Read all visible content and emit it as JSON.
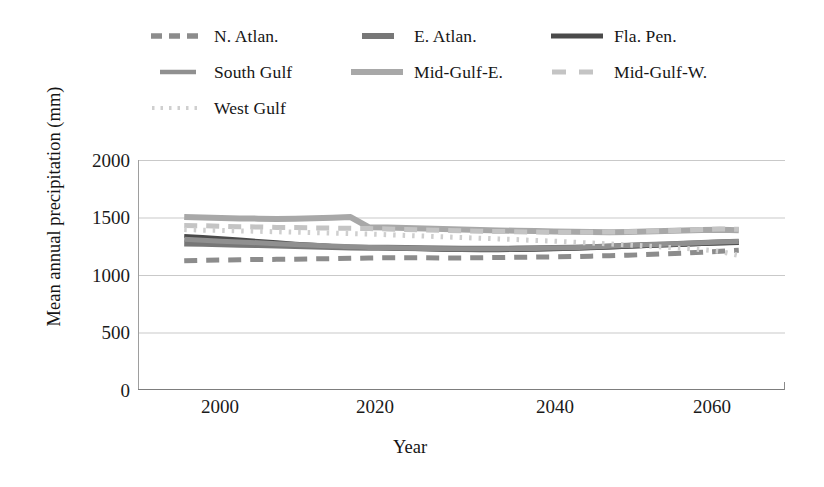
{
  "chart_data": {
    "type": "line",
    "title": "",
    "xlabel": "Year",
    "ylabel": "Mean annual precipitation (mm)",
    "xlim": [
      1995,
      2065
    ],
    "ylim": [
      0,
      2000
    ],
    "yticks": [
      "2000",
      "1500",
      "1000",
      "500",
      "0"
    ],
    "ytick_values": [
      2000,
      1500,
      1000,
      500,
      0
    ],
    "xticks": [
      "2000",
      "2020",
      "2040",
      "2060"
    ],
    "xtick_values": [
      2000,
      2020,
      2040,
      2060
    ],
    "grid": "horizontal",
    "legend_position": "top",
    "x": [
      2000,
      2002,
      2004,
      2006,
      2008,
      2010,
      2012,
      2014,
      2016,
      2018,
      2020,
      2022,
      2024,
      2026,
      2028,
      2030,
      2032,
      2034,
      2036,
      2038,
      2040,
      2042,
      2044,
      2046,
      2048,
      2050,
      2052,
      2054,
      2056,
      2058,
      2060
    ],
    "series": [
      {
        "name": "N. Atlan.",
        "color": "#8c8c8c",
        "dash": "dashed",
        "width": 5,
        "values": [
          1125,
          1128,
          1130,
          1132,
          1135,
          1136,
          1138,
          1140,
          1142,
          1145,
          1148,
          1150,
          1150,
          1150,
          1148,
          1148,
          1150,
          1152,
          1154,
          1156,
          1158,
          1160,
          1164,
          1168,
          1172,
          1178,
          1184,
          1190,
          1198,
          1206,
          1215
        ]
      },
      {
        "name": "E. Atlan.",
        "color": "#777777",
        "dash": "solid-thick",
        "width": 6,
        "values": [
          1275,
          1272,
          1268,
          1264,
          1260,
          1256,
          1252,
          1248,
          1244,
          1240,
          1238,
          1236,
          1234,
          1232,
          1230,
          1228,
          1228,
          1228,
          1230,
          1232,
          1234,
          1238,
          1242,
          1248,
          1254,
          1260,
          1266,
          1272,
          1278,
          1284,
          1290
        ]
      },
      {
        "name": "Fla. Pen.",
        "color": "#4a4a4a",
        "dash": "solid",
        "width": 4,
        "values": [
          1340,
          1330,
          1320,
          1308,
          1296,
          1284,
          1272,
          1262,
          1252,
          1244,
          1238,
          1232,
          1228,
          1224,
          1220,
          1218,
          1216,
          1216,
          1218,
          1220,
          1224,
          1228,
          1234,
          1240,
          1246,
          1252,
          1258,
          1264,
          1270,
          1274,
          1278
        ]
      },
      {
        "name": "South Gulf",
        "color": "#909090",
        "dash": "solid",
        "width": 5,
        "values": [
          1310,
          1302,
          1294,
          1288,
          1280,
          1272,
          1266,
          1258,
          1252,
          1246,
          1240,
          1236,
          1232,
          1230,
          1228,
          1226,
          1226,
          1226,
          1228,
          1230,
          1234,
          1238,
          1244,
          1250,
          1256,
          1262,
          1268,
          1274,
          1280,
          1286,
          1292
        ]
      },
      {
        "name": "Mid-Gulf-E.",
        "color": "#a8a8a8",
        "dash": "solid",
        "width": 6,
        "values": [
          1505,
          1500,
          1496,
          1492,
          1490,
          1488,
          1490,
          1494,
          1498,
          1504,
          1415,
          1412,
          1408,
          1404,
          1400,
          1396,
          1392,
          1388,
          1384,
          1382,
          1378,
          1376,
          1374,
          1372,
          1374,
          1378,
          1382,
          1388,
          1392,
          1394,
          1390
        ]
      },
      {
        "name": "Mid-Gulf-W.",
        "color": "#c4c4c4",
        "dash": "dashed",
        "width": 5,
        "values": [
          1430,
          1428,
          1424,
          1420,
          1418,
          1414,
          1412,
          1410,
          1408,
          1406,
          1404,
          1400,
          1396,
          1392,
          1388,
          1384,
          1380,
          1378,
          1376,
          1374,
          1372,
          1372,
          1372,
          1374,
          1376,
          1380,
          1384,
          1390,
          1396,
          1400,
          1398
        ]
      },
      {
        "name": "West Gulf",
        "color": "#cfcfcf",
        "dash": "dotted",
        "width": 5,
        "values": [
          1395,
          1390,
          1388,
          1384,
          1380,
          1376,
          1372,
          1368,
          1364,
          1360,
          1356,
          1350,
          1344,
          1338,
          1332,
          1326,
          1320,
          1314,
          1308,
          1300,
          1294,
          1286,
          1278,
          1270,
          1262,
          1252,
          1242,
          1232,
          1220,
          1205,
          1170
        ]
      }
    ]
  },
  "legend": {
    "rows": [
      [
        {
          "label": "N. Atlan.",
          "marker": "legend-dash-marker"
        },
        {
          "label": "E. Atlan.",
          "marker": "legend-line-marker"
        },
        {
          "label": "Fla. Pen.",
          "marker": "legend-line-marker"
        }
      ],
      [
        {
          "label": "South Gulf",
          "marker": "legend-line-marker"
        },
        {
          "label": "Mid-Gulf-E.",
          "marker": "legend-line-marker"
        },
        {
          "label": "Mid-Gulf-W.",
          "marker": "legend-dash-marker"
        }
      ],
      [
        {
          "label": "West Gulf",
          "marker": "legend-dot-marker"
        }
      ]
    ]
  },
  "axes": {
    "y_title": "Mean annual precipitation (mm)",
    "x_title": "Year",
    "y_ticks": [
      "2000",
      "1500",
      "1000",
      "500",
      "0"
    ],
    "x_ticks": [
      "2000",
      "2020",
      "2040",
      "2060"
    ]
  },
  "colors": {
    "grid": "#c9c9c9",
    "axis": "#9a9a9a",
    "text": "#1a1a1a"
  }
}
